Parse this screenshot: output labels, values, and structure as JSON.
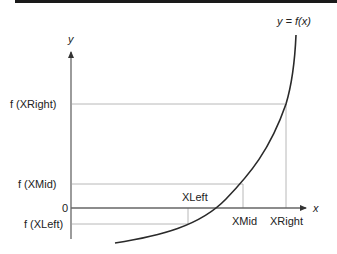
{
  "diagram": {
    "type": "bisection-method-illustration",
    "curve_label": "y = f(x)",
    "axes": {
      "y_label": "y",
      "x_label": "x",
      "origin_label": "0"
    },
    "y_ticks": [
      {
        "label": "f (XRight)"
      },
      {
        "label": "f (XMid)"
      },
      {
        "label": "f (XLeft)"
      }
    ],
    "x_ticks": [
      {
        "label": "XLeft"
      },
      {
        "label": "XMid"
      },
      {
        "label": "XRight"
      }
    ],
    "colors": {
      "curve": "#2a2a2a",
      "axis": "#555555",
      "guide": "#b8b8b8",
      "text": "#222222",
      "topbar": "#1a1a1a"
    }
  }
}
